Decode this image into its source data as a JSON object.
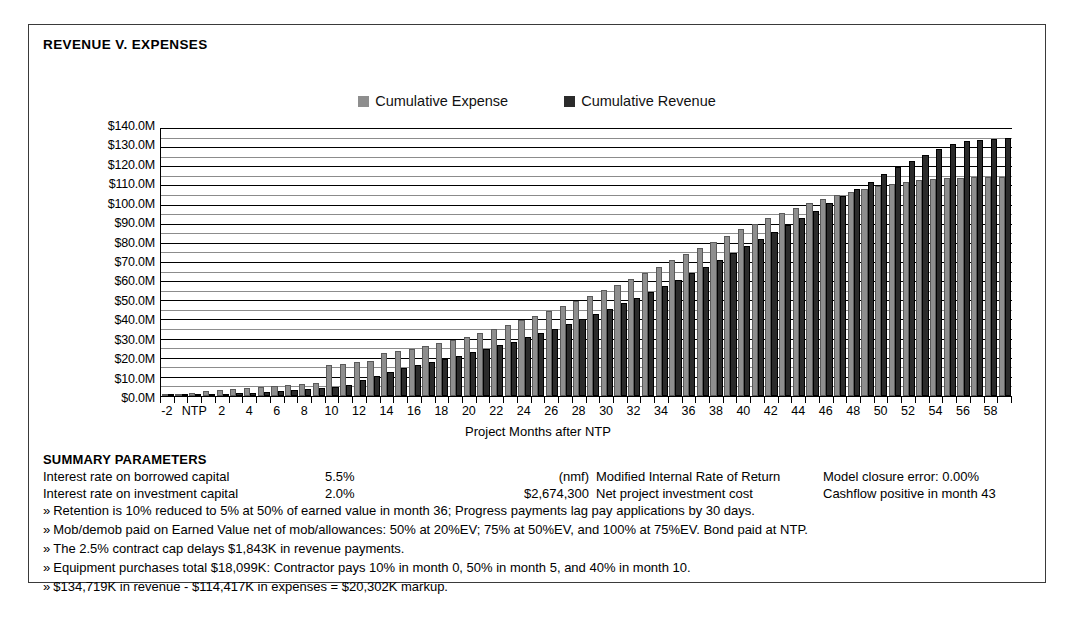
{
  "chart_title": "REVENUE V. EXPENSES",
  "legend": [
    {
      "label": "Cumulative Expense",
      "color": "#8e8e8e",
      "key": "expense"
    },
    {
      "label": "Cumulative Revenue",
      "color": "#2b2b2b",
      "key": "revenue"
    }
  ],
  "chart_data": {
    "type": "bar",
    "title": "REVENUE V. EXPENSES",
    "xlabel": "Project Months after NTP",
    "ylabel": "",
    "ylim": [
      0,
      140
    ],
    "yunit": "M",
    "ytick_labels": [
      "$0.0M",
      "$10.0M",
      "$20.0M",
      "$30.0M",
      "$40.0M",
      "$50.0M",
      "$60.0M",
      "$70.0M",
      "$80.0M",
      "$90.0M",
      "$100.0M",
      "$110.0M",
      "$120.0M",
      "$130.0M",
      "$140.0M"
    ],
    "ytick_values": [
      0,
      10,
      20,
      30,
      40,
      50,
      60,
      70,
      80,
      90,
      100,
      110,
      120,
      130,
      140
    ],
    "gridlines": "every $5M, labels every $10M",
    "legend_position": "top-center",
    "categories": [
      "-2",
      "-1",
      "NTP",
      "1",
      "2",
      "3",
      "4",
      "5",
      "6",
      "7",
      "8",
      "9",
      "10",
      "11",
      "12",
      "13",
      "14",
      "15",
      "16",
      "17",
      "18",
      "19",
      "20",
      "21",
      "22",
      "23",
      "24",
      "25",
      "26",
      "27",
      "28",
      "29",
      "30",
      "31",
      "32",
      "33",
      "34",
      "35",
      "36",
      "37",
      "38",
      "39",
      "40",
      "41",
      "42",
      "43",
      "44",
      "45",
      "46",
      "47",
      "48",
      "49",
      "50",
      "51",
      "52",
      "53",
      "54",
      "55",
      "56",
      "57",
      "58",
      "59"
    ],
    "xtick_labels": [
      "-2",
      "NTP",
      "2",
      "4",
      "6",
      "8",
      "10",
      "12",
      "14",
      "16",
      "18",
      "20",
      "22",
      "24",
      "26",
      "28",
      "30",
      "32",
      "34",
      "36",
      "38",
      "40",
      "42",
      "44",
      "46",
      "48",
      "50",
      "52",
      "54",
      "56",
      "58"
    ],
    "series": [
      {
        "name": "Cumulative Expense",
        "color": "#8e8e8e",
        "values": [
          1.0,
          1.3,
          1.6,
          2.6,
          3.2,
          3.6,
          4.2,
          4.6,
          5.0,
          5.6,
          6.2,
          6.8,
          16.0,
          16.8,
          17.6,
          18.4,
          22.4,
          23.6,
          24.8,
          26.0,
          27.6,
          29.2,
          31.0,
          33.0,
          35.0,
          37.2,
          39.6,
          42.0,
          44.4,
          47.0,
          49.8,
          52.4,
          55.2,
          58.2,
          61.2,
          64.4,
          67.6,
          70.8,
          74.2,
          77.4,
          80.6,
          83.8,
          87.0,
          90.0,
          93.0,
          95.6,
          98.2,
          100.6,
          102.8,
          104.8,
          106.6,
          108.2,
          109.6,
          110.8,
          111.8,
          112.6,
          113.2,
          113.7,
          114.0,
          114.2,
          114.35,
          114.417
        ]
      },
      {
        "name": "Cumulative Revenue",
        "color": "#2b2b2b",
        "values": [
          0.0,
          0.0,
          0.2,
          0.6,
          1.0,
          1.4,
          1.8,
          2.2,
          2.6,
          3.0,
          3.6,
          4.2,
          4.8,
          6.0,
          8.2,
          10.4,
          12.6,
          14.4,
          16.0,
          17.6,
          19.2,
          21.0,
          22.8,
          24.6,
          26.4,
          28.4,
          30.6,
          32.8,
          35.2,
          37.6,
          40.2,
          42.8,
          45.6,
          48.4,
          51.4,
          54.4,
          57.6,
          60.8,
          64.2,
          67.6,
          71.2,
          74.8,
          78.4,
          82.0,
          85.6,
          89.2,
          93.0,
          96.8,
          100.6,
          104.4,
          108.2,
          112.0,
          115.8,
          119.4,
          122.8,
          126.0,
          129.0,
          131.4,
          133.0,
          133.9,
          134.4,
          134.719
        ]
      }
    ]
  },
  "summary": {
    "heading": "SUMMARY PARAMETERS",
    "rows": [
      {
        "label": "Interest rate on borrowed capital",
        "value": "5.5%",
        "value2": "(nmf)",
        "desc2": "Modified Internal Rate of Return",
        "note": "Model closure error: 0.00%"
      },
      {
        "label": "Interest rate on investment capital",
        "value": "2.0%",
        "value2": "$2,674,300",
        "desc2": "Net project investment cost",
        "note": "Cashflow positive in month 43"
      }
    ],
    "bullet_marker": "»",
    "bullets": [
      "Retention is 10% reduced to 5% at 50% of earned value in month 36; Progress payments lag pay applications by 30 days.",
      "Mob/demob paid on Earned Value net of mob/allowances: 50% at 20%EV; 75% at 50%EV, and 100% at 75%EV.  Bond paid at NTP.",
      "The 2.5% contract cap delays $1,843K in revenue payments.",
      "Equipment purchases total $18,099K: Contractor pays 10% in month 0, 50% in month 5, and 40% in month 10.",
      "$134,719K in revenue - $114,417K in expenses = $20,302K markup."
    ]
  }
}
